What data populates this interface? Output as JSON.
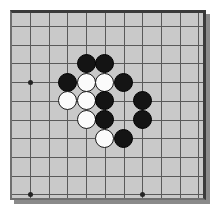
{
  "app": {
    "title": "Go Board Position",
    "background_color": "#ffffff"
  },
  "board": {
    "name": "goban",
    "wood_color": "#c9c9c9",
    "line_color": "#5a5a5a",
    "border_color": "#3a3a3a",
    "shadow_color": "#8a8a8a",
    "x": 10,
    "y": 10,
    "width": 196,
    "height": 190,
    "columns": 11,
    "rows": 10,
    "origin_x": 18,
    "origin_y": 13,
    "spacing": 18.7,
    "star_points": [
      {
        "col": 0,
        "row": 3
      },
      {
        "col": 0,
        "row": 9
      },
      {
        "col": 6,
        "row": 9
      }
    ],
    "stone_radius": 9.6,
    "black_color": "#141414",
    "white_color": "#fbfbfb"
  },
  "stones": [
    {
      "color": "black",
      "col": 3,
      "row": 2
    },
    {
      "color": "black",
      "col": 4,
      "row": 2
    },
    {
      "color": "black",
      "col": 2,
      "row": 3
    },
    {
      "color": "white",
      "col": 3,
      "row": 3
    },
    {
      "color": "white",
      "col": 4,
      "row": 3
    },
    {
      "color": "black",
      "col": 5,
      "row": 3
    },
    {
      "color": "white",
      "col": 2,
      "row": 4
    },
    {
      "color": "white",
      "col": 3,
      "row": 4
    },
    {
      "color": "black",
      "col": 4,
      "row": 4
    },
    {
      "color": "black",
      "col": 6,
      "row": 4
    },
    {
      "color": "white",
      "col": 3,
      "row": 5
    },
    {
      "color": "black",
      "col": 4,
      "row": 5
    },
    {
      "color": "black",
      "col": 6,
      "row": 5
    },
    {
      "color": "white",
      "col": 4,
      "row": 6
    },
    {
      "color": "black",
      "col": 5,
      "row": 6
    }
  ],
  "counts": {
    "black_stones": 9,
    "white_stones": 6,
    "total_stones": 15
  }
}
